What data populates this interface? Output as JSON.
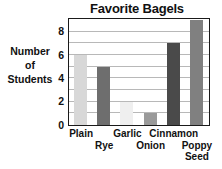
{
  "chart_data": {
    "type": "bar",
    "title": "Favorite Bagels",
    "xlabel": "",
    "ylabel": "Number of Students",
    "ylabel_lines": [
      "Number",
      "of",
      "Students"
    ],
    "categories": [
      "Plain",
      "Rye",
      "Garlic",
      "Onion",
      "Cinnamon",
      "Poppy Seed"
    ],
    "values": [
      6,
      5,
      2,
      1,
      7,
      9
    ],
    "ylim": [
      0,
      9
    ],
    "ytick_labels": [
      "0",
      "2",
      "4",
      "6",
      "8"
    ],
    "ytick_values": [
      0,
      2,
      4,
      6,
      8
    ],
    "gridlines": [
      1,
      2,
      3,
      4,
      5,
      6,
      7,
      8
    ],
    "grid": true,
    "legend": "none",
    "bar_colors": [
      "#d8d8d8",
      "#6e6e6e",
      "#efefef",
      "#9a9a9a",
      "#4a4a4a",
      "#808080"
    ],
    "axis_color": "#1a1a1a",
    "grid_color": "#b8b8b8",
    "background": "#ffffff",
    "bars": [
      {
        "label": "Plain",
        "label_row": 1,
        "value": 6,
        "color": "#d8d8d8"
      },
      {
        "label": "Rye",
        "label_row": 2,
        "value": 5,
        "color": "#6e6e6e"
      },
      {
        "label": "Garlic",
        "label_row": 1,
        "value": 2,
        "color": "#efefef"
      },
      {
        "label": "Onion",
        "label_row": 2,
        "value": 1,
        "color": "#9a9a9a"
      },
      {
        "label": "Cinnamon",
        "label_row": 1,
        "value": 7,
        "color": "#4a4a4a"
      },
      {
        "label": "Poppy Seed",
        "label_row": 2,
        "value": 9,
        "color": "#808080",
        "label_line1": "Poppy",
        "label_line2": "Seed"
      }
    ]
  }
}
